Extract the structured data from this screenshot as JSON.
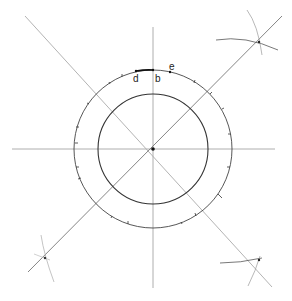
{
  "diagram": {
    "center": {
      "x": 153,
      "y": 149
    },
    "inner_radius": 55,
    "outer_radius": 79,
    "labels": {
      "d": "d",
      "b": "b",
      "e": "e"
    },
    "colors": {
      "line": "#555555",
      "light_line": "#aaaaaa",
      "circle": "#333333"
    }
  }
}
